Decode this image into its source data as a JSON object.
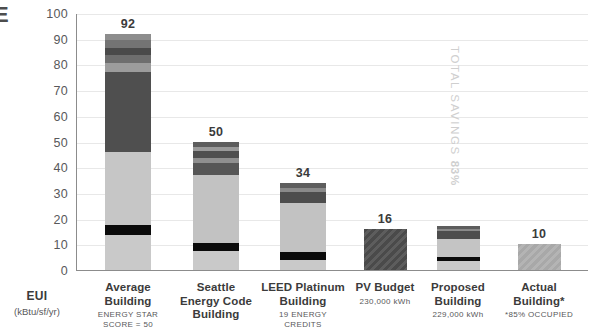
{
  "edge_glyph": "E",
  "axis_title": {
    "main": "EUI",
    "sub": "(kBtu/sf/yr)"
  },
  "annotation": {
    "text": "TOTAL SAVINGS ",
    "percent": "83%"
  },
  "chart_data": {
    "type": "bar",
    "title": "",
    "xlabel": "EUI (kBtu/sf/yr)",
    "ylabel": "EUI (kBtu/sf/yr)",
    "ylim": [
      0,
      100
    ],
    "grid": true,
    "legend": "none",
    "stacked": true,
    "yticks": [
      0,
      10,
      20,
      30,
      40,
      50,
      60,
      70,
      80,
      90,
      100
    ],
    "ytick_labels": [
      "0",
      "10",
      "20",
      "30",
      "40",
      "50",
      "60",
      "70",
      "80",
      "90",
      "100"
    ],
    "categories": [
      "Average Building",
      "Seattle Energy Code Building",
      "LEED Platinum Building",
      "PV Budget",
      "Proposed Building",
      "Actual Building*"
    ],
    "values": [
      92,
      50,
      34,
      16,
      17,
      10
    ],
    "data_labels": [
      "92",
      "50",
      "34",
      "16",
      "",
      "10"
    ],
    "bars": [
      {
        "name": "Average Building",
        "label": "92",
        "show_label": true,
        "total": 92,
        "hatch": false,
        "segments": [
          {
            "value": 13.5,
            "color": "#c9c9c9"
          },
          {
            "value": 4.0,
            "color": "#0b0b0b"
          },
          {
            "value": 28.5,
            "color": "#c6c6c6"
          },
          {
            "value": 31.0,
            "color": "#4f4f4f"
          },
          {
            "value": 3.5,
            "color": "#9c9c9c"
          },
          {
            "value": 3.0,
            "color": "#6e6e6e"
          },
          {
            "value": 3.0,
            "color": "#4a4a4a"
          },
          {
            "value": 3.0,
            "color": "#747474"
          },
          {
            "value": 2.5,
            "color": "#8d8d8d"
          }
        ]
      },
      {
        "name": "Seattle Energy Code Building",
        "label": "50",
        "show_label": true,
        "total": 50,
        "hatch": false,
        "segments": [
          {
            "value": 7.5,
            "color": "#c9c9c9"
          },
          {
            "value": 3.0,
            "color": "#0b0b0b"
          },
          {
            "value": 26.5,
            "color": "#c2c2c2"
          },
          {
            "value": 4.5,
            "color": "#565656"
          },
          {
            "value": 2.0,
            "color": "#8f8f8f"
          },
          {
            "value": 3.0,
            "color": "#4f4f4f"
          },
          {
            "value": 1.5,
            "color": "#9a9a9a"
          },
          {
            "value": 2.0,
            "color": "#5d5d5d"
          }
        ]
      },
      {
        "name": "LEED Platinum Building",
        "label": "34",
        "show_label": true,
        "total": 34,
        "hatch": false,
        "segments": [
          {
            "value": 4.0,
            "color": "#c9c9c9"
          },
          {
            "value": 3.0,
            "color": "#0b0b0b"
          },
          {
            "value": 19.0,
            "color": "#c2c2c2"
          },
          {
            "value": 4.5,
            "color": "#4d4d4d"
          },
          {
            "value": 1.5,
            "color": "#8a8a8a"
          },
          {
            "value": 2.0,
            "color": "#5e5e5e"
          }
        ]
      },
      {
        "name": "PV Budget",
        "label": "16",
        "show_label": true,
        "total": 16,
        "hatch": true,
        "hatch_base": "#4a4a4a",
        "hatch_line": "#5d5d5d",
        "segments": [
          {
            "value": 16.0,
            "color": "#4a4a4a"
          }
        ]
      },
      {
        "name": "Proposed Building",
        "label": "",
        "show_label": false,
        "total": 17,
        "hatch": false,
        "segments": [
          {
            "value": 3.5,
            "color": "#cacaca"
          },
          {
            "value": 1.5,
            "color": "#0b0b0b"
          },
          {
            "value": 7.0,
            "color": "#c4c4c4"
          },
          {
            "value": 3.0,
            "color": "#4d4d4d"
          },
          {
            "value": 1.0,
            "color": "#8a8a8a"
          },
          {
            "value": 1.0,
            "color": "#5e5e5e"
          }
        ]
      },
      {
        "name": "Actual Building*",
        "label": "10",
        "show_label": true,
        "total": 10,
        "hatch": true,
        "hatch_base": "#a8a8a8",
        "hatch_line": "#b4b4b4",
        "segments": [
          {
            "value": 10.0,
            "color": "#a8a8a8"
          }
        ]
      }
    ]
  },
  "x_labels": [
    {
      "title": "Average\nBuilding",
      "sub": "ENERGY STAR\nSCORE = 50"
    },
    {
      "title": "Seattle\nEnergy Code\nBuilding",
      "sub": ""
    },
    {
      "title": "LEED Platinum\nBuilding",
      "sub": "19 ENERGY\nCREDITS"
    },
    {
      "title": "PV Budget",
      "sub": "230,000 kWh"
    },
    {
      "title": "Proposed\nBuilding",
      "sub": "229,000 kWh"
    },
    {
      "title": "Actual\nBuilding*",
      "sub": "*85% OCCUPIED"
    }
  ]
}
